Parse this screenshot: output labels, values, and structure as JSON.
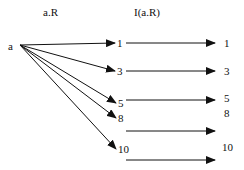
{
  "headers": {
    "left": "a.R",
    "right": "I(a.R)"
  },
  "source": {
    "label": "a",
    "x": 12,
    "y": 47
  },
  "origin": {
    "x": 20,
    "y": 45
  },
  "middle_nodes": [
    {
      "label": "1",
      "x": 116,
      "y": 43
    },
    {
      "label": "3",
      "x": 116,
      "y": 71
    },
    {
      "label": "5",
      "x": 117,
      "y": 103
    },
    {
      "label": "8",
      "x": 117,
      "y": 118
    },
    {
      "label": "10",
      "x": 117,
      "y": 149
    }
  ],
  "right_arrows": [
    {
      "x1": 126,
      "x2": 215,
      "y": 43
    },
    {
      "x1": 126,
      "x2": 215,
      "y": 71
    },
    {
      "x1": 126,
      "x2": 215,
      "y": 100
    },
    {
      "x1": 126,
      "x2": 215,
      "y": 131
    },
    {
      "x1": 126,
      "x2": 215,
      "y": 160
    }
  ],
  "right_labels": [
    {
      "label": "1",
      "x": 224,
      "y": 43
    },
    {
      "label": "3",
      "x": 224,
      "y": 71
    },
    {
      "label": "5",
      "x": 224,
      "y": 98
    },
    {
      "label": "8",
      "x": 224,
      "y": 113
    },
    {
      "label": "10",
      "x": 222,
      "y": 147
    }
  ],
  "colors": {
    "line": "#111111",
    "background": "#ffffff"
  }
}
